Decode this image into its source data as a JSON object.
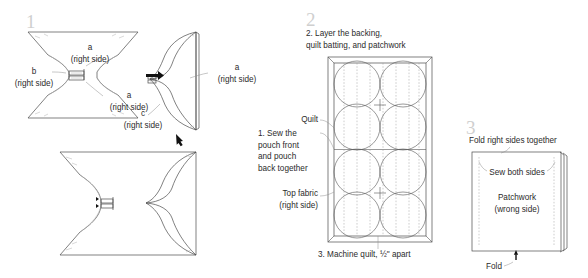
{
  "document": {
    "title": "Patchwork pouch sewing instructions",
    "background_color": "#ffffff",
    "ink_color": "#4a4a4a",
    "step_number_color": "#cfcfcf"
  },
  "steps": [
    {
      "number": "1",
      "labels": {
        "piece_a_top": "a\n(right side)",
        "piece_b_left": "b\n(right side)",
        "piece_a_right": "a\n(right side)",
        "piece_a_folded": "a\n(right side)",
        "piece_c_folded": "c\n(right side)"
      },
      "icons": {
        "transform_arrow": "arrow-right-icon",
        "result_arrow": "arrow-down-left-icon"
      }
    },
    {
      "number": "2",
      "caption": "2. Layer the backing,\nquilt batting, and patchwork",
      "labels": {
        "quilt": "Quilt",
        "sew_pouch": "1. Sew the\npouch front\nand pouch\nback together",
        "top_fabric": "Top fabric\n(right side)"
      },
      "footnote": "3. Machine quilt, ½\" apart"
    },
    {
      "number": "3",
      "labels": {
        "fold_right_sides": "Fold right sides together",
        "sew_both_sides": "Sew both sides",
        "patchwork": "Patchwork\n(wrong side)",
        "fold": "Fold"
      },
      "icons": {
        "fold_arrow": "arrow-up-icon"
      }
    }
  ]
}
